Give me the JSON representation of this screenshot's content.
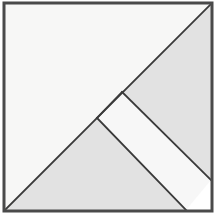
{
  "figure": {
    "type": "geometric-dissection",
    "canvas": {
      "width": 216,
      "height": 215
    },
    "colors": {
      "background": "#ffffff",
      "light_fill": "#f7f7f6",
      "gray_fill": "#e2e2e2",
      "band_fill": "#f7f7f7",
      "stroke": "#3a3a3a",
      "border": "#4a4a4a"
    },
    "frame": {
      "label": "outer-square-border",
      "x": 4,
      "y": 3,
      "width": 208,
      "height": 208,
      "stroke_width": 3
    },
    "pieces": [
      {
        "name": "upper-left-large-triangle",
        "fill_key": "light_fill",
        "points": "5,4 211,4 5,210",
        "vertices": [
          [
            5,
            4
          ],
          [
            211,
            4
          ],
          [
            5,
            210
          ]
        ],
        "description": "Large light triangle occupying the upper-left half of the square"
      },
      {
        "name": "upper-right-triangle",
        "fill_key": "gray_fill",
        "points": "211,4 211,180 122,92",
        "vertices": [
          [
            211,
            4
          ],
          [
            211,
            180
          ],
          [
            122,
            92
          ]
        ],
        "description": "Gray triangle in the upper-right, apex on the main diagonal"
      },
      {
        "name": "parallelogram-band",
        "fill_key": "band_fill",
        "points": "122,92 211,180 186,210 97,118",
        "vertices": [
          [
            122,
            92
          ],
          [
            211,
            180
          ],
          [
            186,
            210
          ],
          [
            97,
            118
          ]
        ],
        "description": "Light parallelogram band running from the main diagonal to the lower-right corner"
      },
      {
        "name": "lower-left-triangle",
        "fill_key": "gray_fill",
        "points": "5,210 97,118 186,210",
        "vertices": [
          [
            5,
            210
          ],
          [
            97,
            118
          ],
          [
            186,
            210
          ]
        ],
        "description": "Gray triangle along the bottom edge with apex on the main diagonal"
      }
    ],
    "edges": [
      {
        "name": "main-diagonal",
        "from": [
          5,
          210
        ],
        "to": [
          211,
          4
        ],
        "description": "Primary diagonal from bottom-left corner to top-right corner"
      },
      {
        "name": "band-upper-edge",
        "from": [
          122,
          92
        ],
        "to": [
          211,
          180
        ],
        "description": "Upper edge of the parallelogram band"
      },
      {
        "name": "band-lower-edge",
        "from": [
          97,
          118
        ],
        "to": [
          186,
          210
        ],
        "description": "Lower edge of the parallelogram band"
      },
      {
        "name": "band-left-cap",
        "from": [
          122,
          92
        ],
        "to": [
          97,
          118
        ],
        "description": "Short segment on the main diagonal joining the two band edges"
      }
    ]
  }
}
